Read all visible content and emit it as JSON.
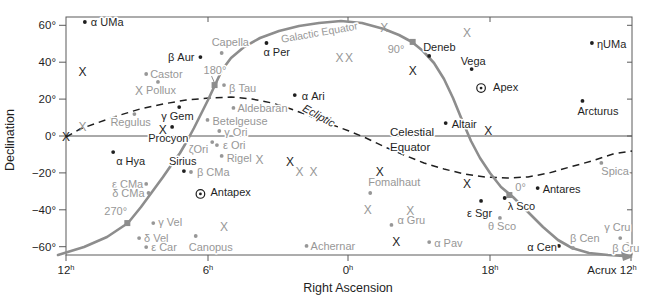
{
  "figure": {
    "width": 654,
    "height": 304,
    "background": "#ffffff"
  },
  "colors": {
    "ink": "#1f1f1f",
    "muted": "#979797",
    "curve": "#8d8d8d",
    "frame": "#5a5a5a",
    "equator_line": "#555555"
  },
  "chart_data": {
    "type": "scatter",
    "xlabel": "Right Ascension",
    "ylabel": "Declination",
    "plot": {
      "left": 66,
      "right": 632,
      "top": 17,
      "bottom": 255,
      "ra_at_left": 12,
      "dec_top": 64.5,
      "dec_bottom": -64.5
    },
    "x_axis": {
      "label": "Right Ascension",
      "ticks": [
        {
          "label": "12h",
          "x": 66
        },
        {
          "label": "6h",
          "x": 208
        },
        {
          "label": "0h",
          "x": 348
        },
        {
          "label": "18h",
          "x": 490
        },
        {
          "label": "Acrux 12h",
          "x": 631,
          "label_x": 612
        }
      ],
      "top_tick_x": [
        208,
        348,
        490
      ]
    },
    "y_axis": {
      "label": "Declination",
      "ticks": [
        {
          "label": "60°",
          "dec": 60
        },
        {
          "label": "40°",
          "dec": 40
        },
        {
          "label": "20°",
          "dec": 20
        },
        {
          "label": "0°",
          "dec": 0
        },
        {
          "label": "−20°",
          "dec": -20
        },
        {
          "label": "−40°",
          "dec": -40
        },
        {
          "label": "−60°",
          "dec": -60
        }
      ]
    },
    "celestial_equator": {
      "label_line1": "Celestial",
      "label_line2": "Equator",
      "dec": 0,
      "label_x": 390,
      "label_y1": 136,
      "label_y2": 151
    },
    "ecliptic": {
      "label": "Ecliptic",
      "label_x": 317,
      "label_y": 119,
      "label_angle": 29,
      "path": [
        [
          66,
          137
        ],
        [
          80,
          129
        ],
        [
          97,
          123
        ],
        [
          117,
          116
        ],
        [
          140,
          109
        ],
        [
          163,
          104
        ],
        [
          186,
          100
        ],
        [
          209,
          98
        ],
        [
          231,
          97
        ],
        [
          252,
          99
        ],
        [
          272,
          103
        ],
        [
          291,
          109
        ],
        [
          310,
          116
        ],
        [
          330,
          124
        ],
        [
          349,
          131
        ],
        [
          366,
          138
        ],
        [
          385,
          147
        ],
        [
          404,
          155
        ],
        [
          424,
          163
        ],
        [
          444,
          169
        ],
        [
          464,
          174
        ],
        [
          485,
          177
        ],
        [
          507,
          178
        ],
        [
          528,
          177
        ],
        [
          549,
          173
        ],
        [
          570,
          167
        ],
        [
          592,
          161
        ],
        [
          613,
          154
        ],
        [
          632,
          151
        ]
      ]
    },
    "galactic_equator": {
      "label": "Galactic Equator",
      "label_x": 320,
      "label_y": 36,
      "label_angle": -10,
      "path": [
        [
          58,
          255
        ],
        [
          84,
          247
        ],
        [
          107,
          237
        ],
        [
          128,
          223
        ],
        [
          141,
          207
        ],
        [
          152,
          192
        ],
        [
          163,
          177
        ],
        [
          172,
          164
        ],
        [
          180,
          153
        ],
        [
          187,
          141
        ],
        [
          194,
          128
        ],
        [
          201,
          114
        ],
        [
          208,
          100
        ],
        [
          215,
          85
        ],
        [
          222,
          70
        ],
        [
          231,
          58
        ],
        [
          244,
          47
        ],
        [
          260,
          38
        ],
        [
          279,
          31
        ],
        [
          299,
          26
        ],
        [
          319,
          23
        ],
        [
          341,
          21
        ],
        [
          362,
          23
        ],
        [
          384,
          29
        ],
        [
          399,
          35
        ],
        [
          412,
          42
        ],
        [
          423,
          51
        ],
        [
          434,
          63
        ],
        [
          444,
          79
        ],
        [
          453,
          98
        ],
        [
          462,
          120
        ],
        [
          471,
          141
        ],
        [
          480,
          158
        ],
        [
          490,
          173
        ],
        [
          501,
          187
        ],
        [
          513,
          197
        ],
        [
          527,
          211
        ],
        [
          543,
          227
        ],
        [
          558,
          240
        ],
        [
          572,
          248
        ],
        [
          589,
          253
        ],
        [
          608,
          255
        ],
        [
          624,
          256
        ]
      ],
      "arrow": [
        [
          633,
          257
        ],
        [
          621,
          251
        ],
        [
          623,
          261
        ]
      ],
      "longitude_markers": [
        {
          "label": "270°",
          "ra": 9.4,
          "dec": -47.2,
          "lx": -23,
          "ly": -8,
          "a": "s"
        },
        {
          "label": "180°",
          "ra": 5.7,
          "dec": 27.6,
          "lx": -11,
          "ly": -11,
          "a": "s",
          "leader": true
        },
        {
          "label": "90°",
          "ra": 21.3,
          "dec": 51.0,
          "lx": -25,
          "ly": 11,
          "a": "s"
        },
        {
          "label": "0°",
          "ra": 17.2,
          "dec": -32.0,
          "lx": 6,
          "ly": -4,
          "a": "s"
        }
      ]
    },
    "stars": [
      {
        "n": "α UMa",
        "ra": 11.2,
        "dec": 61.8,
        "c": "b",
        "lx": 6,
        "ly": 4,
        "a": "s"
      },
      {
        "n": "β Aur",
        "ra": 6.3,
        "dec": 42.8,
        "c": "b",
        "lx": -6,
        "ly": 4,
        "a": "e"
      },
      {
        "n": "Capella",
        "ra": 5.4,
        "dec": 45.0,
        "c": "g",
        "lx": -10,
        "ly": -7,
        "a": "s"
      },
      {
        "n": "Castor",
        "ra": 8.6,
        "dec": 33.6,
        "c": "g",
        "lx": 4,
        "ly": 4,
        "a": "s"
      },
      {
        "n": "Pollux",
        "ra": 8.1,
        "dec": 29.3,
        "c": "g",
        "lx": -12,
        "ly": 12,
        "a": "s"
      },
      {
        "n": "Regulus",
        "ra": 9.1,
        "dec": 11.9,
        "c": "g",
        "lx": -24,
        "ly": 12,
        "a": "s"
      },
      {
        "n": "γ Gem",
        "ra": 7.2,
        "dec": 15.7,
        "c": "b",
        "lx": -18,
        "ly": 13,
        "a": "s"
      },
      {
        "n": "Procyon",
        "ra": 7.5,
        "dec": 4.9,
        "c": "b",
        "lx": -24,
        "ly": 15,
        "a": "s"
      },
      {
        "n": "α Hya",
        "ra": 10.0,
        "dec": -8.7,
        "c": "b",
        "lx": 3,
        "ly": 13,
        "a": "s"
      },
      {
        "n": "Sirius",
        "ra": 7.0,
        "dec": -19.0,
        "c": "b",
        "lx": -15,
        "ly": -6,
        "a": "s"
      },
      {
        "n": "β CMa",
        "ra": 6.7,
        "dec": -19.5,
        "c": "g",
        "lx": 6,
        "ly": 4,
        "a": "s"
      },
      {
        "n": "ε CMa",
        "ra": 8.6,
        "dec": -26.0,
        "c": "g",
        "lx": -3,
        "ly": 4,
        "a": "e"
      },
      {
        "n": "δ CMa",
        "ra": 8.5,
        "dec": -30.9,
        "c": "g",
        "lx": -4,
        "ly": 4,
        "a": "e"
      },
      {
        "n": "ζOri",
        "ra": 5.8,
        "dec": -3.3,
        "c": "g",
        "lx": -4,
        "ly": 11,
        "a": "e"
      },
      {
        "n": "ε Ori",
        "ra": 5.6,
        "dec": -4.9,
        "c": "g",
        "lx": 6,
        "ly": 4,
        "a": "s"
      },
      {
        "n": "γ Ori",
        "ra": 5.5,
        "dec": 2.7,
        "c": "g",
        "lx": 5,
        "ly": 5,
        "a": "s"
      },
      {
        "n": "Rigel",
        "ra": 5.4,
        "dec": -10.8,
        "c": "g",
        "lx": 5,
        "ly": 6,
        "a": "s"
      },
      {
        "n": "Betelgeuse",
        "ra": 6.0,
        "dec": 8.7,
        "c": "g",
        "lx": 5,
        "ly": 5,
        "a": "s"
      },
      {
        "n": "Aldebaran",
        "ra": 4.9,
        "dec": 15.2,
        "c": "g",
        "lx": 4,
        "ly": 4,
        "a": "s"
      },
      {
        "n": "β Tau",
        "ra": 5.3,
        "dec": 27.6,
        "c": "g",
        "lx": 5,
        "ly": 7,
        "a": "s"
      },
      {
        "n": "α Per",
        "ra": 3.5,
        "dec": 50.4,
        "c": "b",
        "lx": -3,
        "ly": 13,
        "a": "s"
      },
      {
        "n": "α Ari",
        "ra": 2.3,
        "dec": 22.2,
        "c": "b",
        "lx": 7,
        "ly": 5,
        "a": "s"
      },
      {
        "n": "Deneb",
        "ra": 20.6,
        "dec": 43.4,
        "c": "b",
        "lx": -6,
        "ly": -5,
        "a": "s"
      },
      {
        "n": "Vega",
        "ra": 18.8,
        "dec": 36.3,
        "c": "b",
        "lx": -11,
        "ly": -4,
        "a": "s"
      },
      {
        "n": "ηUMa",
        "ra": 13.7,
        "dec": 50.4,
        "c": "b",
        "lx": 5,
        "ly": 5,
        "a": "s"
      },
      {
        "n": "Arcturus",
        "ra": 14.1,
        "dec": 19.0,
        "c": "b",
        "lx": -5,
        "ly": 14,
        "a": "s"
      },
      {
        "n": "Altair",
        "ra": 19.9,
        "dec": 7.0,
        "c": "b",
        "lx": 6,
        "ly": 5,
        "a": "s"
      },
      {
        "n": "Antares",
        "ra": 16.0,
        "dec": -28.2,
        "c": "b",
        "lx": 5,
        "ly": 5,
        "a": "s"
      },
      {
        "n": "λ Sco",
        "ra": 17.4,
        "dec": -33.6,
        "c": "b",
        "lx": 3,
        "ly": 12,
        "a": "s"
      },
      {
        "n": "ε Sgr",
        "ra": 18.4,
        "dec": -35.2,
        "c": "b",
        "lx": -14,
        "ly": 16,
        "a": "s"
      },
      {
        "n": "θ Sco",
        "ra": 17.6,
        "dec": -44.4,
        "c": "g",
        "lx": -12,
        "ly": 12,
        "a": "s"
      },
      {
        "n": "α Cen",
        "ra": 15.1,
        "dec": -59.6,
        "c": "b",
        "lx": -2,
        "ly": 5,
        "a": "e"
      },
      {
        "n": "β Cen",
        "ra": 14.5,
        "dec": -60.7,
        "c": "g",
        "lx": -3,
        "ly": -6,
        "a": "s"
      },
      {
        "n": "γ Cru",
        "ra": 12.5,
        "dec": -55.3,
        "c": "g",
        "lx": -16,
        "ly": -7,
        "a": "s"
      },
      {
        "n": "β Cru",
        "ra": 12.2,
        "dec": -58.5,
        "c": "g",
        "lx": -15,
        "ly": 8,
        "a": "s"
      },
      {
        "n": "Spica",
        "ra": 13.3,
        "dec": -14.6,
        "c": "g",
        "lx": 0,
        "ly": 12,
        "a": "s"
      },
      {
        "n": "Fomalhaut",
        "ra": 23.1,
        "dec": -30.9,
        "c": "g",
        "lx": -2,
        "ly": -7,
        "a": "s"
      },
      {
        "n": "Achernar",
        "ra": 1.8,
        "dec": -59.6,
        "c": "g",
        "lx": 4,
        "ly": 4,
        "a": "s"
      },
      {
        "n": "α Gru",
        "ra": 22.2,
        "dec": -48.2,
        "c": "g",
        "lx": 6,
        "ly": -1,
        "a": "s"
      },
      {
        "n": "α Pav",
        "ra": 20.6,
        "dec": -57.5,
        "c": "g",
        "lx": 5,
        "ly": 5,
        "a": "s"
      },
      {
        "n": "Canopus",
        "ra": 6.5,
        "dec": -54.2,
        "c": "g",
        "lx": -7,
        "ly": 15,
        "a": "s"
      },
      {
        "n": "γ Vel",
        "ra": 8.3,
        "dec": -47.2,
        "c": "g",
        "lx": 5,
        "ly": 3,
        "a": "s"
      },
      {
        "n": "δ Vel",
        "ra": 8.9,
        "dec": -55.3,
        "c": "g",
        "lx": 5,
        "ly": 4,
        "a": "s"
      },
      {
        "n": "ε Car",
        "ra": 8.6,
        "dec": -60.2,
        "c": "g",
        "lx": 5,
        "ly": 4,
        "a": "s"
      },
      {
        "n": "Apex",
        "ra": 18.4,
        "dec": 26.0,
        "c": "b",
        "lx": 12,
        "ly": 3,
        "a": "s",
        "sym": "target"
      },
      {
        "n": "Antapex",
        "ra": 6.3,
        "dec": -31.4,
        "c": "b",
        "lx": 10,
        "ly": 2,
        "a": "s",
        "sym": "target"
      }
    ],
    "x_sources": [
      {
        "ra": 12.0,
        "dec": -0.5,
        "c": "b"
      },
      {
        "ra": 11.3,
        "dec": 4.9,
        "c": "g"
      },
      {
        "ra": 11.3,
        "dec": 34.7,
        "c": "b"
      },
      {
        "ra": 8.9,
        "dec": 24.4,
        "c": "g"
      },
      {
        "ra": 7.9,
        "dec": 3.3,
        "c": "b"
      },
      {
        "ra": 3.8,
        "dec": -13.0,
        "c": "g"
      },
      {
        "ra": 2.5,
        "dec": -14.1,
        "c": "b"
      },
      {
        "ra": 2.1,
        "dec": -19.5,
        "c": "g"
      },
      {
        "ra": 1.5,
        "dec": -19.5,
        "c": "g"
      },
      {
        "ra": 0.4,
        "dec": 42.3,
        "c": "g"
      },
      {
        "ra": 0.0,
        "dec": 42.3,
        "c": "g"
      },
      {
        "ra": 22.5,
        "dec": 58.5,
        "c": "g"
      },
      {
        "ra": 19.0,
        "dec": 55.8,
        "c": "g"
      },
      {
        "ra": 21.3,
        "dec": 35.2,
        "c": "b"
      },
      {
        "ra": 18.1,
        "dec": 2.7,
        "c": "b"
      },
      {
        "ra": 22.7,
        "dec": -19.5,
        "c": "b"
      },
      {
        "ra": 19.0,
        "dec": -26.0,
        "c": "b"
      },
      {
        "ra": 23.2,
        "dec": -40.1,
        "c": "g"
      },
      {
        "ra": 21.4,
        "dec": -40.7,
        "c": "g"
      },
      {
        "ra": 22.0,
        "dec": -57.5,
        "c": "b"
      },
      {
        "ra": 5.3,
        "dec": -49.3,
        "c": "g"
      }
    ]
  }
}
